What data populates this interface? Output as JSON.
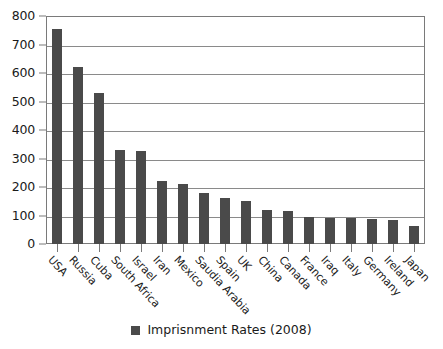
{
  "chart_data": {
    "type": "bar",
    "title": "",
    "xlabel": "",
    "ylabel": "",
    "ylim": [
      0,
      800
    ],
    "yticks": [
      0,
      100,
      200,
      300,
      400,
      500,
      600,
      700,
      800
    ],
    "grid": true,
    "legend_position": "bottom",
    "series_name": "Imprisnment Rates (2008)",
    "bar_color": "#4a4a4a",
    "categories": [
      "USA",
      "Russia",
      "Cuba",
      "South Africa",
      "Israel",
      "Iran",
      "Mexico",
      "Saudia Arabia",
      "Spain",
      "UK",
      "China",
      "Canada",
      "France",
      "Iraq",
      "Italy",
      "Germany",
      "Ireland",
      "Japan"
    ],
    "values": [
      756,
      620,
      531,
      330,
      325,
      222,
      209,
      178,
      160,
      152,
      119,
      116,
      96,
      93,
      92,
      89,
      85,
      63
    ],
    "series": [
      {
        "name": "Imprisnment Rates (2008)",
        "values": [
          756,
          620,
          531,
          330,
          325,
          222,
          209,
          178,
          160,
          152,
          119,
          116,
          96,
          93,
          92,
          89,
          85,
          63
        ]
      }
    ]
  },
  "legend": {
    "label": "Imprisnment Rates (2008)"
  }
}
